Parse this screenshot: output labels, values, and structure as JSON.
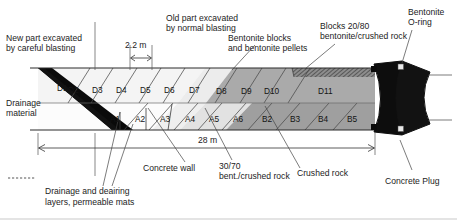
{
  "figure": {
    "type": "engineering-cross-section",
    "title_visible": false,
    "scale_dimensions": [
      {
        "id": "width-22",
        "label": "2.2 m",
        "x1": 130,
        "x2": 152,
        "y": 60
      },
      {
        "id": "length-28",
        "label": "28 m",
        "x1": 38,
        "x2": 375,
        "y": 148
      }
    ]
  },
  "callouts": {
    "new_part": {
      "line1": "New part excavated",
      "line2": "by careful blasting"
    },
    "old_part": {
      "line1": "Old part excavated",
      "line2": "by normal blasting"
    },
    "bentonite_blocks": {
      "line1": "Bentonite blocks",
      "line2": "and bentonite pellets"
    },
    "blocks_2080": {
      "line1": "Blocks 20/80",
      "line2": "bentonite/crushed rock"
    },
    "bentonite_oring": {
      "line1": "Bentonite",
      "line2": "O-ring"
    },
    "drainage_material": {
      "line1": "Drainage",
      "line2": "material"
    },
    "drainage_deairing": {
      "line1": "Drainage and deairing",
      "line2": "layers, permeable mats"
    },
    "concrete_wall": {
      "line1": "Concrete wall"
    },
    "bent_3070": {
      "line1": "30/70",
      "line2": "bent./crushed rock"
    },
    "crushed_rock": {
      "line1": "Crushed rock"
    },
    "concrete_plug": {
      "line1": "Concrete Plug"
    }
  },
  "cells": {
    "top_row_name": "D-series",
    "bottom_row_name": "A/B-series",
    "top_row": [
      {
        "label": "D1",
        "x": 57,
        "y": 88
      },
      {
        "label": "D2",
        "x": 80,
        "y": 89
      },
      {
        "label": "D3",
        "x": 103,
        "y": 89
      },
      {
        "label": "D4",
        "x": 127,
        "y": 89
      },
      {
        "label": "D5",
        "x": 151,
        "y": 89
      },
      {
        "label": "D6",
        "x": 175,
        "y": 89
      },
      {
        "label": "D7",
        "x": 200,
        "y": 89
      },
      {
        "label": "D8",
        "x": 232,
        "y": 90
      },
      {
        "label": "D9",
        "x": 257,
        "y": 90
      },
      {
        "label": "D10",
        "x": 279,
        "y": 90
      },
      {
        "label": "D11",
        "x": 325,
        "y": 90
      }
    ],
    "bottom_row": [
      {
        "label": "A1",
        "x": 112,
        "y": 118
      },
      {
        "label": "A2",
        "x": 137,
        "y": 118
      },
      {
        "label": "A3",
        "x": 162,
        "y": 118
      },
      {
        "label": "A4",
        "x": 187,
        "y": 118
      },
      {
        "label": "A5",
        "x": 211,
        "y": 118
      },
      {
        "label": "A6",
        "x": 234,
        "y": 118
      },
      {
        "label": "B2",
        "x": 265,
        "y": 118
      },
      {
        "label": "B3",
        "x": 292,
        "y": 118
      },
      {
        "label": "B4",
        "x": 320,
        "y": 118
      },
      {
        "label": "B5",
        "x": 349,
        "y": 118
      }
    ]
  },
  "colors": {
    "background": "#ffffff",
    "line": "#2b2b2b",
    "drainage_wedge": "#0a0a0a",
    "concrete_plug": "#0d0d0d",
    "d_light": "#f2f2f2",
    "d_mid": "#e4e4e4",
    "d_dark": "#a9a9a9",
    "a_light": "#fbfbfb",
    "a_mid": "#ededed",
    "b_dark": "#9e9e9e",
    "hatch_band": "#6f6f6f",
    "text": "#1c1c1c"
  },
  "legend": {
    "dashed_marker_present": true,
    "dashed_marker_label": "Drainage and deairing layers, permeable mats"
  }
}
